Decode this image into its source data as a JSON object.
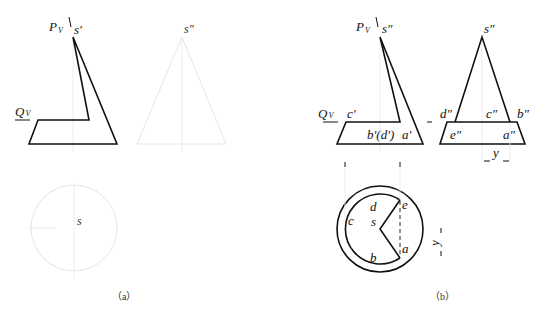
{
  "figure_a": {
    "caption": "（a）",
    "front_view": {
      "plane_p_label": "P",
      "plane_p_sub": "V",
      "plane_q_label": "Q",
      "plane_q_sub": "V",
      "apex_label": "s′"
    },
    "side_view": {
      "apex_label": "s″"
    },
    "top_view": {
      "center_label": "s"
    }
  },
  "figure_b": {
    "caption": "（b）",
    "front_view": {
      "plane_p_label": "P",
      "plane_p_sub": "V",
      "plane_q_label": "Q",
      "plane_q_sub": "V",
      "apex_label": "s″",
      "point_c": "c′",
      "point_bd": "b′(d′)",
      "point_a": "a′"
    },
    "side_view": {
      "apex_label": "s″",
      "point_d": "d″",
      "point_c": "c″",
      "point_b": "b″",
      "point_e": "e″",
      "point_a": "a″",
      "dim_label": "y"
    },
    "top_view": {
      "center_label": "s",
      "point_d": "d",
      "point_e": "e",
      "point_c": "c",
      "point_b": "b",
      "point_a": "a",
      "dim_label": "y"
    }
  },
  "colors": {
    "line": "#111111",
    "construction": "#e6e6e6",
    "background": "#ffffff"
  }
}
